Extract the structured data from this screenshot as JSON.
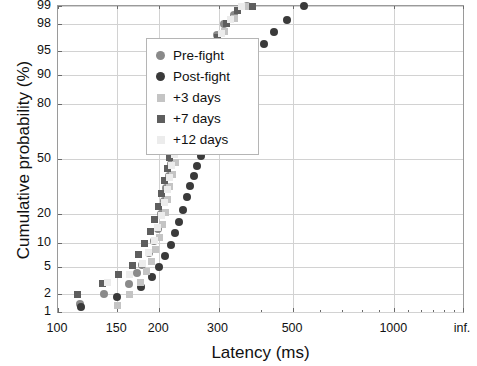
{
  "chart_data": {
    "type": "scatter",
    "title": "",
    "xlabel": "Latency (ms)",
    "ylabel": "Cumulative probability (%)",
    "x_scale": "log",
    "y_scale": "probit",
    "xlim": [
      100,
      1600
    ],
    "ylim": [
      1,
      99
    ],
    "grid": true,
    "legend_position": "upper-left",
    "xticks": [
      100,
      150,
      200,
      300,
      500,
      1000,
      1600
    ],
    "xticklabels": [
      "100",
      "150",
      "200",
      "300",
      "500",
      "1000",
      "inf."
    ],
    "yticks": [
      1,
      2,
      5,
      10,
      20,
      50,
      80,
      90,
      95,
      98,
      99
    ],
    "yticklabels": [
      "1",
      "2",
      "5",
      "10",
      "20",
      "50",
      "80",
      "90",
      "95",
      "98",
      "99"
    ],
    "series": [
      {
        "name": "Pre-fight",
        "marker": "circle",
        "color": "#8a8a8a",
        "points": [
          [
            116,
            1.4
          ],
          [
            137,
            2.0
          ],
          [
            162,
            2.9
          ],
          [
            172,
            4.2
          ],
          [
            178,
            5.4
          ],
          [
            186,
            7.6
          ],
          [
            193,
            10.5
          ],
          [
            198,
            14.5
          ],
          [
            202,
            20.0
          ],
          [
            206,
            26.0
          ],
          [
            210,
            33.0
          ],
          [
            214,
            40.0
          ],
          [
            217,
            47.0
          ],
          [
            221,
            54.0
          ],
          [
            226,
            61.0
          ],
          [
            231,
            68.0
          ],
          [
            236,
            74.0
          ],
          [
            242,
            79.5
          ],
          [
            248,
            84.0
          ],
          [
            255,
            88.0
          ],
          [
            263,
            91.0
          ],
          [
            272,
            93.5
          ],
          [
            283,
            95.5
          ],
          [
            296,
            97.0
          ],
          [
            312,
            98.0
          ],
          [
            334,
            98.6
          ],
          [
            365,
            99.0
          ]
        ]
      },
      {
        "name": "Post-fight",
        "marker": "circle",
        "color": "#3a3a3a",
        "points": [
          [
            117,
            1.2
          ],
          [
            150,
            1.8
          ],
          [
            176,
            2.6
          ],
          [
            190,
            3.7
          ],
          [
            199,
            5.0
          ],
          [
            208,
            7.0
          ],
          [
            216,
            9.5
          ],
          [
            223,
            13.0
          ],
          [
            229,
            17.0
          ],
          [
            235,
            22.0
          ],
          [
            241,
            28.0
          ],
          [
            247,
            34.0
          ],
          [
            253,
            40.0
          ],
          [
            259,
            46.0
          ],
          [
            266,
            52.0
          ],
          [
            273,
            58.0
          ],
          [
            281,
            64.0
          ],
          [
            289,
            69.5
          ],
          [
            298,
            75.0
          ],
          [
            308,
            79.5
          ],
          [
            319,
            83.5
          ],
          [
            332,
            87.0
          ],
          [
            347,
            90.0
          ],
          [
            364,
            92.5
          ],
          [
            385,
            94.5
          ],
          [
            410,
            96.0
          ],
          [
            440,
            97.3
          ],
          [
            480,
            98.3
          ],
          [
            540,
            99.0
          ]
        ]
      },
      {
        "name": "+3 days",
        "marker": "square",
        "color": "#c4c4c4",
        "points": [
          [
            150,
            1.3
          ],
          [
            163,
            2.0
          ],
          [
            176,
            3.0
          ],
          [
            183,
            4.4
          ],
          [
            190,
            6.0
          ],
          [
            195,
            8.5
          ],
          [
            200,
            11.5
          ],
          [
            204,
            16.0
          ],
          [
            208,
            21.0
          ],
          [
            212,
            27.0
          ],
          [
            215,
            34.0
          ],
          [
            219,
            41.0
          ],
          [
            223,
            48.0
          ],
          [
            227,
            55.0
          ],
          [
            232,
            62.0
          ],
          [
            237,
            69.0
          ],
          [
            243,
            75.0
          ],
          [
            249,
            80.5
          ],
          [
            256,
            85.0
          ],
          [
            264,
            88.5
          ],
          [
            273,
            91.5
          ],
          [
            284,
            94.0
          ],
          [
            297,
            96.0
          ],
          [
            313,
            97.4
          ],
          [
            334,
            98.4
          ],
          [
            360,
            99.0
          ]
        ]
      },
      {
        "name": "+7 days",
        "marker": "square",
        "color": "#5e5e5e",
        "points": [
          [
            114,
            2.0
          ],
          [
            136,
            2.9
          ],
          [
            151,
            4.0
          ],
          [
            166,
            5.2
          ],
          [
            174,
            7.3
          ],
          [
            181,
            10.0
          ],
          [
            188,
            13.5
          ],
          [
            194,
            18.0
          ],
          [
            199,
            23.5
          ],
          [
            203,
            30.0
          ],
          [
            207,
            37.0
          ],
          [
            211,
            44.0
          ],
          [
            215,
            51.0
          ],
          [
            220,
            58.0
          ],
          [
            225,
            64.5
          ],
          [
            231,
            71.0
          ],
          [
            237,
            77.0
          ],
          [
            244,
            82.0
          ],
          [
            252,
            86.5
          ],
          [
            261,
            90.0
          ],
          [
            271,
            92.8
          ],
          [
            283,
            95.0
          ],
          [
            298,
            96.8
          ],
          [
            317,
            98.0
          ],
          [
            342,
            98.8
          ],
          [
            378,
            99.0
          ]
        ]
      },
      {
        "name": "+12 days",
        "marker": "square",
        "color": "#ececec",
        "points": [
          [
            140,
            3.0
          ],
          [
            163,
            4.0
          ],
          [
            178,
            5.6
          ],
          [
            186,
            7.8
          ],
          [
            193,
            10.8
          ],
          [
            198,
            14.8
          ],
          [
            203,
            19.5
          ],
          [
            207,
            25.5
          ],
          [
            211,
            32.0
          ],
          [
            214,
            39.0
          ],
          [
            218,
            46.0
          ],
          [
            222,
            53.0
          ],
          [
            226,
            60.0
          ],
          [
            231,
            66.5
          ],
          [
            236,
            73.0
          ],
          [
            242,
            78.5
          ],
          [
            249,
            83.5
          ],
          [
            257,
            87.5
          ],
          [
            266,
            90.8
          ],
          [
            277,
            93.5
          ],
          [
            290,
            95.6
          ],
          [
            306,
            97.2
          ],
          [
            326,
            98.3
          ],
          [
            352,
            99.0
          ]
        ]
      }
    ]
  }
}
